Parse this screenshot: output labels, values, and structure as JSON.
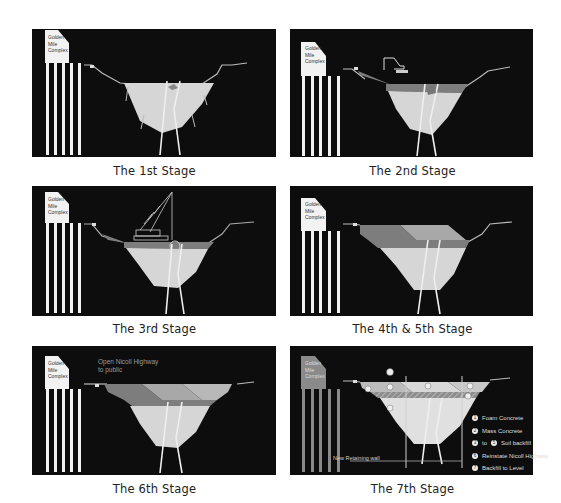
{
  "building": {
    "line1": "Golden",
    "line2": "Mile",
    "line3": "Complex"
  },
  "stages": [
    {
      "id": 1,
      "caption": "The 1st Stage"
    },
    {
      "id": 2,
      "caption": "The 2nd Stage"
    },
    {
      "id": 3,
      "caption": "The 3rd Stage"
    },
    {
      "id": 4,
      "caption": "The 4th & 5th Stage"
    },
    {
      "id": 5,
      "caption": "The 6th Stage"
    },
    {
      "id": 6,
      "caption": "The 7th Stage"
    }
  ],
  "stage6_note": {
    "line1": "Open Nicoll Highway",
    "line2": "to public"
  },
  "stage7": {
    "wall_label": "New Retaining wall",
    "legend": [
      {
        "num": "1",
        "text": "Foam Concrete"
      },
      {
        "num": "2",
        "text": "Mass Concrete"
      },
      {
        "num": "3",
        "num2": "5",
        "text_to": "to",
        "text": "Soil backfill"
      },
      {
        "num": "6",
        "text": "Reinstate Nicoll Highway"
      },
      {
        "num": "7",
        "text": "Backfill to Level"
      }
    ],
    "markers": [
      "1",
      "2",
      "3",
      "4",
      "5",
      "6",
      "7",
      "8"
    ]
  },
  "colors": {
    "panel_bg": "#0d0d0d",
    "fill_light": "#d6d6d6",
    "fill_mid": "#a8a8a8",
    "fill_dark": "#7d7d7d",
    "building": "#f2f2f2",
    "building_7th": "#8a8a8a"
  }
}
